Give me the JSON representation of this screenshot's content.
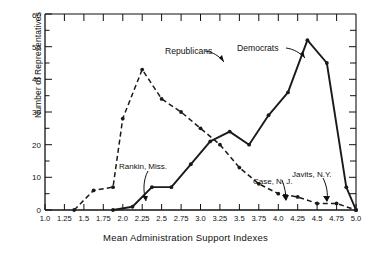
{
  "chart_data": {
    "type": "line",
    "title": "",
    "xlabel": "Mean Administration Support Indexes",
    "ylabel": "Number of Representatives",
    "xlim": [
      1.0,
      5.0
    ],
    "ylim": [
      0,
      60
    ],
    "xticks": [
      "1.0",
      "1.25",
      "1.5",
      "1.75",
      "2.0",
      "2.25",
      "2.5",
      "2.75",
      "3.0",
      "3.25",
      "3.5",
      "3.75",
      "4.0",
      "4.25",
      "4.5",
      "4.75",
      "5.0"
    ],
    "yticks": [
      "0",
      "10",
      "20",
      "30",
      "40",
      "50",
      "60"
    ],
    "y_minor_interval": 5,
    "grid": false,
    "legend_position": "inline-annotations",
    "series": [
      {
        "name": "Republicans",
        "linestyle": "dashed",
        "color": "#1a1a1a",
        "marker": "dot",
        "x": [
          1.375,
          1.625,
          1.875,
          2.0,
          2.25,
          2.5,
          2.75,
          3.0,
          3.25,
          3.5,
          3.75,
          4.0,
          4.25,
          4.5,
          4.75,
          5.0
        ],
        "y": [
          0,
          6,
          7,
          28,
          43,
          34,
          30,
          25,
          20,
          13,
          8,
          5,
          4,
          2,
          2,
          0
        ]
      },
      {
        "name": "Democrats",
        "linestyle": "solid",
        "color": "#1a1a1a",
        "marker": "dot",
        "x": [
          1.875,
          2.125,
          2.375,
          2.625,
          2.875,
          3.125,
          3.375,
          3.625,
          3.875,
          4.125,
          4.375,
          4.625,
          4.875,
          5.0
        ],
        "y": [
          0,
          1,
          7,
          7,
          14,
          21,
          24,
          20,
          29,
          36,
          52,
          45,
          7,
          0
        ]
      }
    ],
    "annotations": [
      {
        "text": "Republicans",
        "target_x": 2.38,
        "target_y": 40
      },
      {
        "text": "Democrats",
        "target_x": 4.3,
        "target_y": 47
      },
      {
        "text": "Rankin, Miss.",
        "target_x": 2.13,
        "target_y": 1.5
      },
      {
        "text": "Case, N. J.",
        "target_x": 4.1,
        "target_y": 2.0
      },
      {
        "text": "Javits, N.Y.",
        "target_x": 4.65,
        "target_y": 1.5
      }
    ]
  }
}
